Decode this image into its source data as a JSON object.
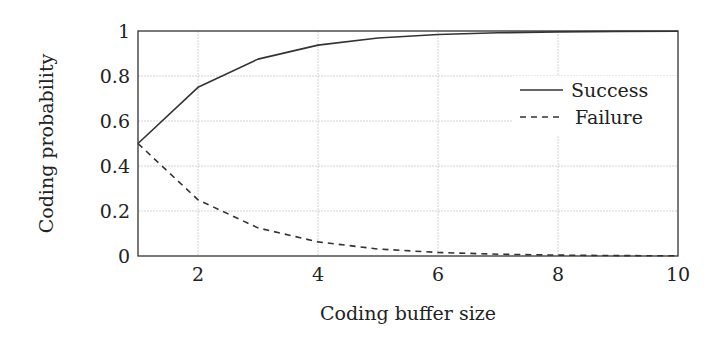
{
  "chart_data": {
    "type": "line",
    "title": "",
    "xlabel": "Coding buffer size",
    "ylabel": "Coding probability",
    "xlim": [
      1,
      10
    ],
    "ylim": [
      0,
      1
    ],
    "grid": true,
    "legend_position": "upper right",
    "x": [
      1,
      2,
      3,
      4,
      5,
      6,
      7,
      8,
      9,
      10
    ],
    "series": [
      {
        "name": "Success",
        "style": "solid",
        "values": [
          0.5,
          0.75,
          0.875,
          0.9375,
          0.96875,
          0.984375,
          0.9921875,
          0.99609375,
          0.998046875,
          0.9990234375
        ]
      },
      {
        "name": "Failure",
        "style": "dashed",
        "values": [
          0.5,
          0.25,
          0.125,
          0.0625,
          0.03125,
          0.015625,
          0.0078125,
          0.00390625,
          0.001953125,
          0.0009765625
        ]
      }
    ],
    "x_ticks": [
      2,
      4,
      6,
      8,
      10
    ],
    "x_tick_labels": [
      "2",
      "4",
      "6",
      "8",
      "10"
    ],
    "y_ticks": [
      0,
      0.2,
      0.4,
      0.6,
      0.8,
      1
    ],
    "y_tick_labels": [
      "0",
      "0.2",
      "0.4",
      "0.6",
      "0.8",
      "1"
    ]
  },
  "colors": {
    "line": "#333333",
    "grid": "#d4d4d4",
    "axis": "#333333"
  }
}
